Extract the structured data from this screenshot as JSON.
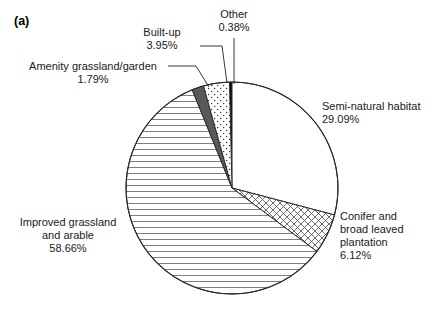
{
  "figure": {
    "panel_label": "(a)"
  },
  "chart_data": {
    "type": "pie",
    "title": "",
    "xlabel": "",
    "ylabel": "",
    "legend_position": "none",
    "grid": false,
    "units": "percent",
    "start_angle_deg": -91.37,
    "direction": "clockwise",
    "center": {
      "cx": 232,
      "cy": 188,
      "r": 106
    },
    "categories": [
      "Other",
      "Semi-natural habitat",
      "Conifer and broad leaved plantation",
      "Improved grassland and arable",
      "Amenity grassland/garden",
      "Built-up"
    ],
    "values": [
      0.38,
      29.09,
      6.12,
      58.66,
      1.79,
      3.95
    ],
    "slices": [
      {
        "name": "Other",
        "label": "Other",
        "value": 0.38,
        "value_text": "0.38%",
        "fill": "#000000",
        "pattern": "solid-black",
        "label_pos": {
          "x": 203,
          "y": 8,
          "w": 62,
          "align": "center"
        },
        "leader": {
          "x1": 234,
          "y1": 38,
          "x2": 234,
          "y2": 84
        }
      },
      {
        "name": "Semi-natural habitat",
        "label": "Semi-natural habitat",
        "value": 29.09,
        "value_text": "29.09%",
        "fill": "#ffffff",
        "pattern": "blank",
        "label_pos": {
          "x": 322,
          "y": 100,
          "w": 112,
          "align": "left"
        },
        "leader": null
      },
      {
        "name": "Conifer and broad leaved plantation",
        "label": "Conifer and\nbroad leaved\nplantation",
        "label_lines": [
          "Conifer and",
          "broad leaved",
          "plantation"
        ],
        "value": 6.12,
        "value_text": "6.12%",
        "fill": "#ffffff",
        "pattern": "cross-hatch",
        "label_pos": {
          "x": 340,
          "y": 210,
          "w": 92,
          "align": "left"
        },
        "leader": null
      },
      {
        "name": "Improved grassland and arable",
        "label": "Improved grassland\nand arable",
        "label_lines": [
          "Improved grassland",
          "and arable"
        ],
        "value": 58.66,
        "value_text": "58.66%",
        "fill": "#ffffff",
        "pattern": "horizontal-lines",
        "label_pos": {
          "x": 10,
          "y": 216,
          "w": 116,
          "align": "center"
        },
        "leader": null
      },
      {
        "name": "Amenity grassland/garden",
        "label": "Amenity grassland/garden",
        "value": 1.79,
        "value_text": "1.79%",
        "fill": "#595959",
        "pattern": "solid-gray",
        "label_pos": {
          "x": 24,
          "y": 60,
          "w": 138,
          "align": "center"
        },
        "leader": {
          "x1": 168,
          "y1": 66,
          "x2": 196,
          "y2": 66,
          "x3": 209,
          "y3": 87
        }
      },
      {
        "name": "Built-up",
        "label": "Built-up",
        "value": 3.95,
        "value_text": "3.95%",
        "fill": "#ffffff",
        "pattern": "dotted",
        "label_pos": {
          "x": 128,
          "y": 26,
          "w": 68,
          "align": "center"
        },
        "leader": {
          "x1": 200,
          "y1": 46,
          "x2": 222,
          "y2": 46,
          "x3": 227,
          "y3": 83
        }
      }
    ]
  }
}
